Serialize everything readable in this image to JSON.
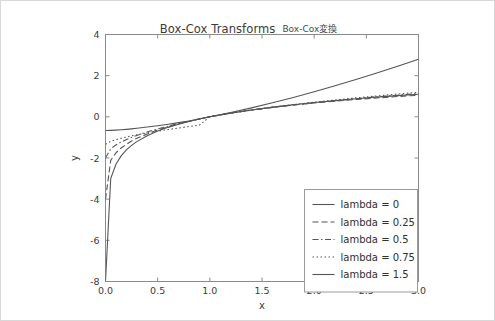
{
  "title": {
    "main": "Box-Cox Transforms",
    "secondary": "Box-Cox変換"
  },
  "axis": {
    "xlabel": "x",
    "ylabel": "y",
    "xticks": [
      "0.0",
      "0.5",
      "1.0",
      "1.5",
      "2.0",
      "2.5",
      "3.0"
    ],
    "yticks": [
      "4",
      "2",
      "0",
      "-2",
      "-4",
      "-6",
      "-8"
    ]
  },
  "legend": {
    "items": [
      {
        "label": "lambda = 0",
        "style": "solid"
      },
      {
        "label": "lambda = 0.25",
        "style": "dashed"
      },
      {
        "label": "lambda = 0.5",
        "style": "dashdot"
      },
      {
        "label": "lambda = 0.75",
        "style": "dotted"
      },
      {
        "label": "lambda = 1.5",
        "style": "solid"
      }
    ]
  },
  "colors": {
    "line": "#555555",
    "spine": "#8a8a8a",
    "text": "#3c3c3c",
    "background": "#ffffff",
    "border": "#d8d8d8"
  },
  "chart_data": {
    "type": "line",
    "title": "Box-Cox Transforms",
    "subtitle": "Box-Cox変換",
    "xlabel": "x",
    "ylabel": "y",
    "xlim": [
      0.0,
      3.0
    ],
    "ylim": [
      -8,
      4
    ],
    "grid": false,
    "legend_position": "lower right",
    "xticks": [
      0.0,
      0.5,
      1.0,
      1.5,
      2.0,
      2.5,
      3.0
    ],
    "yticks": [
      -8,
      -6,
      -4,
      -2,
      0,
      2,
      4
    ],
    "x": [
      0.0,
      0.05,
      0.1,
      0.15,
      0.2,
      0.25,
      0.3,
      0.4,
      0.5,
      0.6,
      0.7,
      0.8,
      0.9,
      1.0,
      1.2,
      1.4,
      1.6,
      1.8,
      2.0,
      2.2,
      2.4,
      2.6,
      2.8,
      3.0
    ],
    "series": [
      {
        "name": "lambda = 0",
        "lambda": 0,
        "style": "solid",
        "values": [
          -8.0,
          -3.0,
          -2.303,
          -1.897,
          -1.609,
          -1.386,
          -1.204,
          -0.916,
          -0.693,
          -0.511,
          -0.357,
          -0.223,
          -0.105,
          0.0,
          0.182,
          0.336,
          0.47,
          0.588,
          0.693,
          0.788,
          0.875,
          0.956,
          1.03,
          1.099
        ]
      },
      {
        "name": "lambda = 0.25",
        "lambda": 0.25,
        "style": "dashed",
        "values": [
          -4.0,
          -2.116,
          -1.75,
          -1.514,
          -1.337,
          -1.172,
          -1.04,
          -0.839,
          -0.637,
          -0.483,
          -0.344,
          -0.217,
          -0.103,
          0.0,
          0.18,
          0.329,
          0.457,
          0.57,
          0.67,
          0.759,
          0.84,
          0.915,
          0.985,
          1.049
        ]
      },
      {
        "name": "lambda = 0.5",
        "lambda": 0.5,
        "style": "dashdot",
        "values": [
          -2.0,
          -1.553,
          -1.368,
          -1.225,
          -1.106,
          -1.0,
          -0.904,
          -0.735,
          -0.586,
          -0.451,
          -0.327,
          -0.211,
          -0.103,
          0.0,
          0.191,
          0.332,
          0.46,
          0.577,
          0.686,
          0.787,
          0.88,
          0.969,
          1.052,
          1.131
        ]
      },
      {
        "name": "lambda = 0.75",
        "lambda": 0.75,
        "style": "dotted",
        "values": [
          -1.333,
          -1.192,
          -1.109,
          -1.041,
          -0.981,
          -0.926,
          -0.875,
          -0.782,
          -0.697,
          -0.618,
          -0.543,
          -0.472,
          -0.404,
          -0.0,
          0.178,
          0.332,
          0.47,
          0.595,
          0.71,
          0.818,
          0.92,
          1.016,
          1.107,
          1.194
        ]
      },
      {
        "name": "lambda = 1.5",
        "lambda": 1.5,
        "style": "solid",
        "values": [
          -0.667,
          -0.659,
          -0.646,
          -0.628,
          -0.607,
          -0.583,
          -0.557,
          -0.497,
          -0.431,
          -0.359,
          -0.283,
          -0.203,
          -0.097,
          0.0,
          0.209,
          0.437,
          0.682,
          0.942,
          1.219,
          1.509,
          1.813,
          2.13,
          2.459,
          2.799
        ]
      }
    ]
  }
}
